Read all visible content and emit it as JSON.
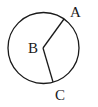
{
  "diagram": {
    "type": "circle-with-radii",
    "circle": {
      "cx": 43.5,
      "cy": 48,
      "r": 35.5,
      "stroke": "#1a1a1a"
    },
    "center": {
      "label": "B",
      "x": 43,
      "y": 48
    },
    "points": [
      {
        "label": "A",
        "x": 64,
        "y": 19
      },
      {
        "label": "C",
        "x": 53,
        "y": 82
      }
    ],
    "labels": {
      "A": "A",
      "B": "B",
      "C": "C"
    }
  }
}
